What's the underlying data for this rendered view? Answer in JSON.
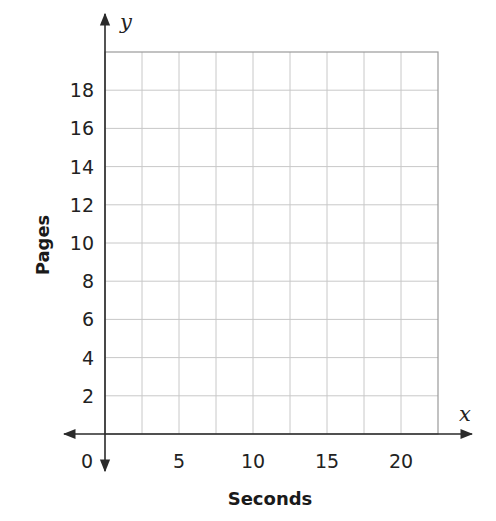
{
  "chart_data": {
    "type": "scatter",
    "title": "",
    "xlabel": "Seconds",
    "ylabel": "Pages",
    "x_axis_variable": "x",
    "y_axis_variable": "y",
    "xlim": [
      0,
      22.5
    ],
    "ylim": [
      0,
      20
    ],
    "x_ticks": [
      0,
      5,
      10,
      15,
      20
    ],
    "x_tick_labels": [
      "0",
      "5",
      "10",
      "15",
      "20"
    ],
    "y_ticks": [
      2,
      4,
      6,
      8,
      10,
      12,
      14,
      16,
      18
    ],
    "y_tick_labels": [
      "2",
      "4",
      "6",
      "8",
      "10",
      "12",
      "14",
      "16",
      "18"
    ],
    "x_grid_step": 2.5,
    "y_grid_step": 2,
    "grid": true,
    "series": [],
    "legend": null
  },
  "colors": {
    "grid": "#c8c8c8",
    "axis": "#2a2a2a",
    "text": "#222222"
  }
}
